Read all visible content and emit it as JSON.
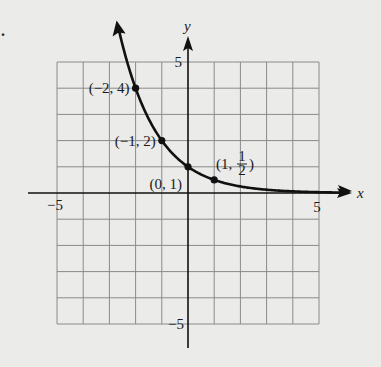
{
  "chart_data": {
    "type": "line",
    "title": "",
    "function": "y = (1/2)^x",
    "xlabel": "x",
    "ylabel": "y",
    "xlim": [
      -5,
      5
    ],
    "ylim": [
      -5,
      5
    ],
    "grid": true,
    "tick_labels": {
      "x_neg": "−5",
      "x_pos": "5",
      "y_pos": "5",
      "y_neg": "−5"
    },
    "points": [
      {
        "x": -2,
        "y": 4,
        "label": "(−2, 4)"
      },
      {
        "x": -1,
        "y": 2,
        "label": "(−1, 2)"
      },
      {
        "x": 0,
        "y": 1,
        "label": "(0, 1)"
      },
      {
        "x": 1,
        "y": 0.5,
        "label_prefix": "(1, ",
        "label_num": "1",
        "label_den": "2",
        "label_suffix": ")"
      }
    ],
    "curve_x_range": [
      -2.65,
      6.0
    ],
    "colors": {
      "curve": "#111111",
      "grid": "#8a8a8a",
      "axis": "#111111",
      "background": "#ebebea"
    }
  },
  "stray_mark": "."
}
